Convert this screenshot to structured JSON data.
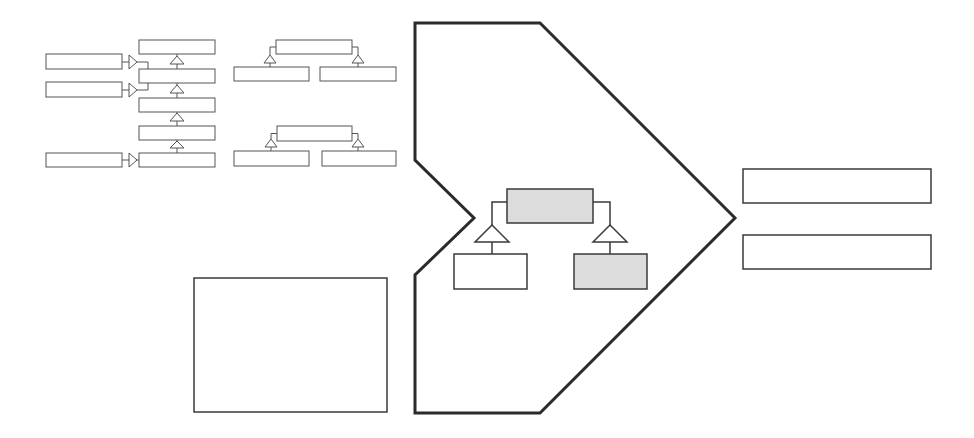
{
  "canvas": {
    "width": 974,
    "height": 438,
    "background": "#ffffff"
  },
  "colors": {
    "stroke_dark": "#2b2b2b",
    "stroke_mid": "#3a3a3a",
    "stroke_thin": "#555555",
    "gray_fill": "#dcdcdc",
    "white_fill": "#ffffff"
  },
  "diagrams": {
    "chain": {
      "description": "vertical inheritance chain with three external composition arrows",
      "stack_boxes": [
        {
          "x": 139,
          "y": 40,
          "w": 76,
          "h": 14
        },
        {
          "x": 139,
          "y": 69,
          "w": 76,
          "h": 14
        },
        {
          "x": 139,
          "y": 98,
          "w": 76,
          "h": 14
        },
        {
          "x": 139,
          "y": 126,
          "w": 76,
          "h": 14
        },
        {
          "x": 139,
          "y": 153,
          "w": 76,
          "h": 14
        }
      ],
      "side_boxes": [
        {
          "x": 46,
          "y": 54,
          "w": 76,
          "h": 15
        },
        {
          "x": 46,
          "y": 82,
          "w": 76,
          "h": 15
        },
        {
          "x": 46,
          "y": 153,
          "w": 76,
          "h": 14
        }
      ],
      "up_triangles": [
        {
          "cx": 177,
          "tip": 56,
          "base": 64
        },
        {
          "cx": 177,
          "tip": 85,
          "base": 93
        },
        {
          "cx": 177,
          "tip": 113,
          "base": 121
        },
        {
          "cx": 177,
          "tip": 141,
          "base": 148
        }
      ],
      "right_arrows": [
        {
          "y": 62,
          "x0": 129,
          "x1": 137
        },
        {
          "y": 90,
          "x0": 129,
          "x1": 137
        },
        {
          "y": 160,
          "x0": 129,
          "x1": 137
        }
      ]
    },
    "tree_small_1": {
      "parent": {
        "x": 276,
        "y": 40,
        "w": 76,
        "h": 14
      },
      "children": [
        {
          "x": 234,
          "y": 67,
          "w": 75,
          "h": 14
        },
        {
          "x": 320,
          "y": 67,
          "w": 76,
          "h": 14
        }
      ],
      "triangles": [
        {
          "cx": 270,
          "tip": 55,
          "base": 63
        },
        {
          "cx": 358,
          "tip": 55,
          "base": 63
        }
      ]
    },
    "tree_small_2": {
      "parent": {
        "x": 277,
        "y": 126,
        "w": 75,
        "h": 15
      },
      "children": [
        {
          "x": 234,
          "y": 151,
          "w": 75,
          "h": 15
        },
        {
          "x": 322,
          "y": 151,
          "w": 74,
          "h": 15
        }
      ],
      "triangles": [
        {
          "cx": 271,
          "tip": 139,
          "base": 147
        },
        {
          "cx": 358,
          "tip": 139,
          "base": 147
        }
      ]
    },
    "empty_box": {
      "x": 194,
      "y": 278,
      "w": 193,
      "h": 134
    },
    "arrow_shape": {
      "points": [
        [
          415,
          23
        ],
        [
          540,
          23
        ],
        [
          735,
          218
        ],
        [
          540,
          413
        ],
        [
          415,
          413
        ],
        [
          415,
          275
        ],
        [
          474,
          218
        ],
        [
          415,
          160
        ]
      ]
    },
    "center_tree": {
      "parent": {
        "x": 507,
        "y": 189,
        "w": 86,
        "h": 34,
        "fill": "#dcdcdc"
      },
      "children": [
        {
          "x": 454,
          "y": 254,
          "w": 73,
          "h": 35,
          "fill": "#ffffff"
        },
        {
          "x": 574,
          "y": 254,
          "w": 73,
          "h": 35,
          "fill": "#dcdcdc"
        }
      ],
      "triangles": [
        {
          "cx": 492,
          "tip": 225,
          "base": 242,
          "half": 17
        },
        {
          "cx": 610,
          "tip": 225,
          "base": 242,
          "half": 17
        }
      ]
    },
    "right_boxes": [
      {
        "x": 743,
        "y": 169,
        "w": 188,
        "h": 34
      },
      {
        "x": 743,
        "y": 235,
        "w": 188,
        "h": 34
      }
    ]
  }
}
